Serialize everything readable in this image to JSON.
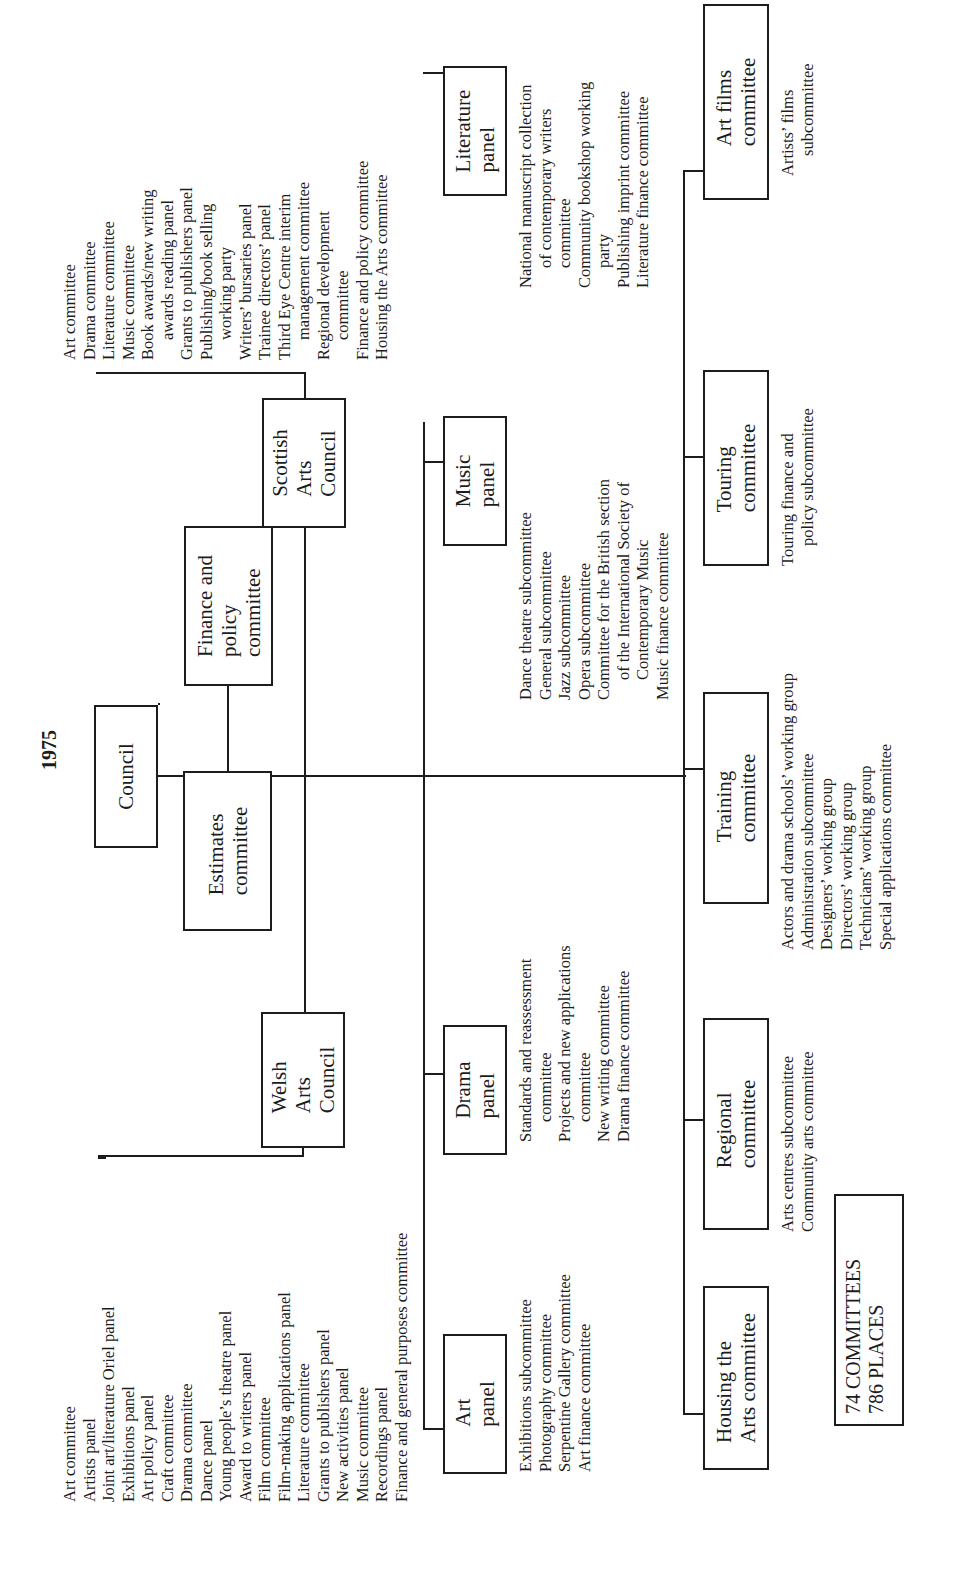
{
  "orientation": "rotated-90-ccw",
  "title": "1975",
  "council": "Council",
  "finance_policy": "Finance and\npolicy\ncommittee",
  "estimates": "Estimates\ncommittee",
  "welsh": {
    "label": "Welsh\n   Arts\n     Council",
    "items": [
      {
        "t": "Art committee"
      },
      {
        "t": "Artists panel"
      },
      {
        "t": "Joint art/literature Oriel panel"
      },
      {
        "t": "Exhibitions panel"
      },
      {
        "t": "Art policy panel"
      },
      {
        "t": "Craft committee"
      },
      {
        "t": "Drama committee"
      },
      {
        "t": "Dance panel"
      },
      {
        "t": "Young people’s theatre panel"
      },
      {
        "t": "Award to writers panel"
      },
      {
        "t": "Film committee"
      },
      {
        "t": "Film-making applications panel"
      },
      {
        "t": "Literature committee"
      },
      {
        "t": "Grants to publishers panel"
      },
      {
        "t": "New activities panel"
      },
      {
        "t": "Music committee"
      },
      {
        "t": "Recordings panel"
      },
      {
        "t": "Finance and general purposes committee"
      }
    ]
  },
  "scottish": {
    "label": "Scottish\n   Arts\n     Council",
    "items": [
      {
        "t": "Art committee"
      },
      {
        "t": "Drama committee"
      },
      {
        "t": "Literature committee"
      },
      {
        "t": "Music committee"
      },
      {
        "t": "Book awards/new writing"
      },
      {
        "t": "awards reading panel",
        "c": true
      },
      {
        "t": "Grants to publishers panel"
      },
      {
        "t": "Publishing/book selling"
      },
      {
        "t": "working party",
        "c": true
      },
      {
        "t": "Writers’ bursaries panel"
      },
      {
        "t": "Trainee directors’ panel"
      },
      {
        "t": "Third Eye Centre interim"
      },
      {
        "t": "management committee",
        "c": true
      },
      {
        "t": "Regional development"
      },
      {
        "t": "committee",
        "c": true
      },
      {
        "t": "Finance and policy committee"
      },
      {
        "t": "Housing the Arts committee"
      }
    ]
  },
  "panels": [
    {
      "name": "art",
      "label": "Art\n  panel",
      "items": [
        {
          "t": "Exhibitions subcommittee"
        },
        {
          "t": "Photography committee"
        },
        {
          "t": "Serpentine Gallery committee"
        },
        {
          "t": "Art finance committee"
        }
      ]
    },
    {
      "name": "drama",
      "label": "Drama\n  panel",
      "items": [
        {
          "t": "Standards and reassessment"
        },
        {
          "t": "committee",
          "c": true
        },
        {
          "t": "Projects and new applications"
        },
        {
          "t": "committee",
          "c": true
        },
        {
          "t": "New writing committee"
        },
        {
          "t": "Drama finance committee"
        }
      ]
    },
    {
      "name": "music",
      "label": "Music\n  panel",
      "items": [
        {
          "t": "Dance theatre subcommittee"
        },
        {
          "t": "General subcommittee"
        },
        {
          "t": "Jazz subcommittee"
        },
        {
          "t": "Opera subcommittee"
        },
        {
          "t": "Committee for the British section"
        },
        {
          "t": "of the International Society of",
          "c": true
        },
        {
          "t": "  Contemporary  Music",
          "c": true
        },
        {
          "t": "Music finance committee"
        }
      ]
    },
    {
      "name": "literature",
      "label": "Literature\n  panel",
      "items": [
        {
          "t": "National manuscript collection"
        },
        {
          "t": "of contemporary writers",
          "c": true
        },
        {
          "t": "  committee",
          "c": true
        },
        {
          "t": "Community bookshop working"
        },
        {
          "t": "  party",
          "c": true
        },
        {
          "t": "Publishing imprint committee"
        },
        {
          "t": "Literature finance committee"
        }
      ]
    }
  ],
  "committees": [
    {
      "name": "housing",
      "label": "Housing the\n  Arts committee",
      "items": []
    },
    {
      "name": "regional",
      "label": "Regional\n  committee",
      "items": [
        {
          "t": "Arts centres subcommittee"
        },
        {
          "t": "Community arts committee"
        }
      ]
    },
    {
      "name": "training",
      "label": "Training\n  committee",
      "items": [
        {
          "t": "Actors and drama schools’ working group"
        },
        {
          "t": "Administration subcommittee"
        },
        {
          "t": "Designers’ working group"
        },
        {
          "t": "Directors’ working group"
        },
        {
          "t": "Technicians’ working group"
        },
        {
          "t": "Special applications committee"
        }
      ]
    },
    {
      "name": "touring",
      "label": "Touring\n  committee",
      "items": [
        {
          "t": "Touring finance and"
        },
        {
          "t": "policy subcommittee",
          "c": true
        }
      ]
    },
    {
      "name": "art-films",
      "label": "Art films\n  committee",
      "items": [
        {
          "t": "Artists’ films"
        },
        {
          "t": "subcommittee",
          "c": true
        }
      ]
    }
  ],
  "summary": {
    "line1": "74 COMMITTEES",
    "line2": "786 PLACES"
  }
}
